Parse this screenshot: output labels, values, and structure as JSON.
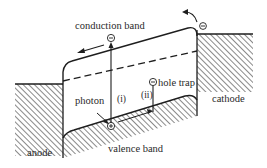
{
  "labels": {
    "conduction_band": "conduction band",
    "valence_band": "valence band",
    "photon": "photon",
    "hole_trap": "hole trap",
    "anode": "anode",
    "cathode": "cathode",
    "transition_i": "(i)",
    "transition_ii": "(ii)"
  },
  "symbols": {
    "electron": "−",
    "hole": "+",
    "hole_trap_charge": "−"
  },
  "colors": {
    "line": "#1e1e1e",
    "hatch": "#3a3a3a",
    "background": "#ffffff"
  }
}
